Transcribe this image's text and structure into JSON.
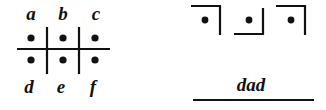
{
  "grid": {
    "top_labels": [
      "a",
      "b",
      "c"
    ],
    "bottom_labels": [
      "d",
      "e",
      "f"
    ]
  },
  "cipher": {
    "symbols": [
      "d",
      "a",
      "d"
    ],
    "word": "dad"
  },
  "colors": {
    "ink": "#111111",
    "background": "#ffffff"
  }
}
